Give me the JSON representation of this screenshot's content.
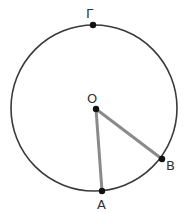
{
  "diagram": {
    "type": "circle-geometry",
    "colors": {
      "circle": "#3a3a3a",
      "segment": "#8a8a8a",
      "point": "#111111",
      "label": "#333333"
    },
    "circle": {
      "center": "O",
      "cx": 94,
      "cy": 108,
      "r": 83
    },
    "points": [
      {
        "id": "G",
        "label": "Γ",
        "x": 93,
        "y": 25,
        "lx": 88,
        "ly": 18
      },
      {
        "id": "O",
        "label": "O",
        "x": 96,
        "y": 109,
        "lx": 92,
        "ly": 102
      },
      {
        "id": "A",
        "label": "A",
        "x": 102,
        "y": 191,
        "lx": 102,
        "ly": 209
      },
      {
        "id": "B",
        "label": "B",
        "x": 162,
        "y": 159,
        "lx": 171,
        "ly": 170
      }
    ],
    "segments": [
      {
        "from": "O",
        "to": "A",
        "label": "OA"
      },
      {
        "from": "O",
        "to": "B",
        "label": "OB"
      }
    ]
  }
}
